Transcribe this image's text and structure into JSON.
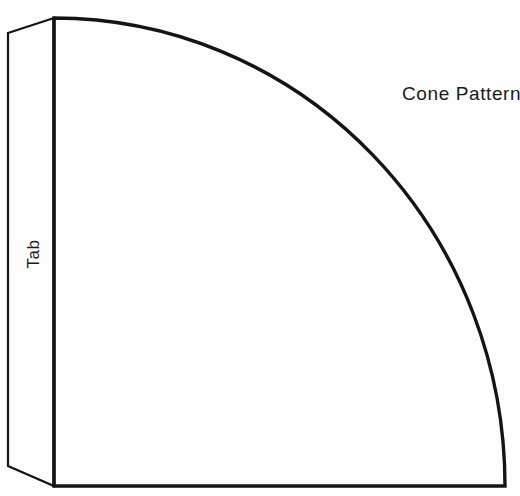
{
  "document": {
    "kind": "craft-template-diagram",
    "subject": "cone pattern cut-out template",
    "background_color": "#fdfdfd",
    "stroke_color": "#141414"
  },
  "labels": {
    "title": "Cone Pattern",
    "tab": "Tab"
  },
  "shapes": {
    "sector": {
      "name": "cone-pattern-sector",
      "description": "quarter ellipse sector forming the cone body",
      "apex": {
        "x": 54,
        "y": 486
      },
      "straight_edge_top": {
        "x": 54,
        "y": 18
      },
      "arc_end": {
        "x": 505,
        "y": 486
      },
      "radius_x": 451,
      "radius_y": 468,
      "stroke_width": 3.4
    },
    "tab": {
      "name": "glue-tab",
      "description": "narrow quadrilateral flap on the left edge for gluing",
      "points": "54,18 8,33 8,466 54,486",
      "stroke_width": 2.2
    }
  }
}
